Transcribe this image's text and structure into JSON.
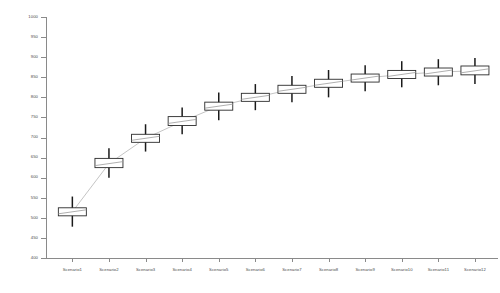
{
  "chart_data": {
    "type": "box",
    "title": "",
    "xlabel": "",
    "ylabel": "",
    "ylim": [
      400,
      1000
    ],
    "grid": false,
    "legend": false,
    "y_ticks": [
      1000,
      950,
      900,
      850,
      800,
      750,
      700,
      650,
      600,
      550,
      500,
      450,
      400
    ],
    "categories": [
      "Scenario1",
      "Scenario2",
      "Scenario3",
      "Scenario4",
      "Scenario5",
      "Scenario6",
      "Scenario7",
      "Scenario8",
      "Scenario9",
      "Scenario10",
      "Scenario11",
      "Scenario12"
    ],
    "boxes": [
      {
        "category": "Scenario1",
        "whisker_low": 478,
        "q1": 505,
        "median": 515,
        "q3": 525,
        "whisker_high": 553
      },
      {
        "category": "Scenario2",
        "whisker_low": 600,
        "q1": 625,
        "median": 635,
        "q3": 648,
        "whisker_high": 673
      },
      {
        "category": "Scenario3",
        "whisker_low": 665,
        "q1": 688,
        "median": 698,
        "q3": 708,
        "whisker_high": 733
      },
      {
        "category": "Scenario4",
        "whisker_low": 708,
        "q1": 730,
        "median": 740,
        "q3": 752,
        "whisker_high": 775
      },
      {
        "category": "Scenario5",
        "whisker_low": 743,
        "q1": 768,
        "median": 778,
        "q3": 788,
        "whisker_high": 812
      },
      {
        "category": "Scenario6",
        "whisker_low": 768,
        "q1": 790,
        "median": 800,
        "q3": 810,
        "whisker_high": 833
      },
      {
        "category": "Scenario7",
        "whisker_low": 788,
        "q1": 810,
        "median": 820,
        "q3": 830,
        "whisker_high": 853
      },
      {
        "category": "Scenario8",
        "whisker_low": 800,
        "q1": 825,
        "median": 835,
        "q3": 845,
        "whisker_high": 868
      },
      {
        "category": "Scenario9",
        "whisker_low": 815,
        "q1": 838,
        "median": 848,
        "q3": 858,
        "whisker_high": 880
      },
      {
        "category": "Scenario10",
        "whisker_low": 825,
        "q1": 847,
        "median": 857,
        "q3": 867,
        "whisker_high": 890
      },
      {
        "category": "Scenario11",
        "whisker_low": 830,
        "q1": 853,
        "median": 863,
        "q3": 873,
        "whisker_high": 895
      },
      {
        "category": "Scenario12",
        "whisker_low": 833,
        "q1": 856,
        "median": 866,
        "q3": 878,
        "whisker_high": 898
      }
    ],
    "colors": {
      "box_stroke": "#2b2b2b",
      "box_fill": "#ffffff",
      "whisker": "#1a1a1a",
      "median": "#9a9a9a",
      "trend": "#b5b5b5",
      "axis": "#8a8a8a",
      "tick_text": "#4a4a4a",
      "background": "#ffffff"
    }
  }
}
